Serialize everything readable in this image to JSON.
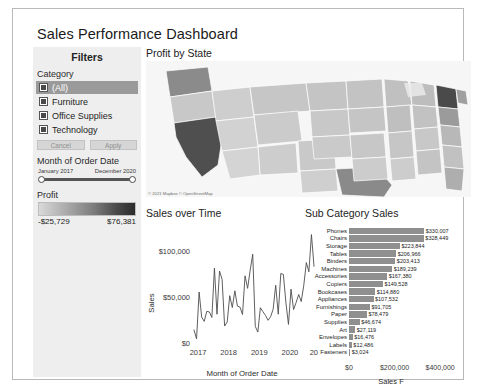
{
  "dashboard": {
    "title": "Sales Performance Dashboard"
  },
  "filters": {
    "header": "Filters",
    "category_label": "Category",
    "options": [
      {
        "label": "(All)",
        "checked": true,
        "selected": true
      },
      {
        "label": "Furniture",
        "checked": true,
        "selected": false
      },
      {
        "label": "Office Supplies",
        "checked": true,
        "selected": false
      },
      {
        "label": "Technology",
        "checked": true,
        "selected": false
      }
    ],
    "cancel_label": "Cancel",
    "apply_label": "Apply",
    "date_label": "Month of Order Date",
    "date_start": "January 2017",
    "date_end": "December 2020",
    "profit_label": "Profit",
    "profit_min": "-$25,729",
    "profit_max": "$76,381"
  },
  "map": {
    "title": "Profit by State",
    "attribution": "© 2021 Mapbox © OpenStreetMap"
  },
  "line_chart_title": "Sales over Time",
  "bar_chart_title": "Sub Category Sales",
  "chart_data": [
    {
      "type": "line",
      "title": "Sales over Time",
      "xlabel": "Month of Order Date",
      "ylabel": "Sales",
      "ytick_labels": [
        "$0",
        "$50,000",
        "$100,000"
      ],
      "ytick_values": [
        0,
        50000,
        100000
      ],
      "ylim": [
        0,
        118000
      ],
      "xtick_labels": [
        "2017",
        "2018",
        "2019",
        "2020",
        "2021"
      ],
      "grid": false,
      "x": [
        "2017-01",
        "2017-02",
        "2017-03",
        "2017-04",
        "2017-05",
        "2017-06",
        "2017-07",
        "2017-08",
        "2017-09",
        "2017-10",
        "2017-11",
        "2017-12",
        "2018-01",
        "2018-02",
        "2018-03",
        "2018-04",
        "2018-05",
        "2018-06",
        "2018-07",
        "2018-08",
        "2018-09",
        "2018-10",
        "2018-11",
        "2018-12",
        "2019-01",
        "2019-02",
        "2019-03",
        "2019-04",
        "2019-05",
        "2019-06",
        "2019-07",
        "2019-08",
        "2019-09",
        "2019-10",
        "2019-11",
        "2019-12",
        "2020-01",
        "2020-02",
        "2020-03",
        "2020-04",
        "2020-05",
        "2020-06",
        "2020-07",
        "2020-08",
        "2020-09",
        "2020-10",
        "2020-11",
        "2020-12"
      ],
      "values": [
        14236,
        4520,
        55691,
        28295,
        23648,
        34595,
        33946,
        27909,
        81777,
        31453,
        78629,
        69545,
        18542,
        22979,
        51716,
        38750,
        56987,
        40344,
        39262,
        31115,
        73410,
        59688,
        79412,
        96999,
        18174,
        11951,
        38560,
        34196,
        30131,
        24797,
        28765,
        36898,
        63133,
        31453,
        75972,
        74920,
        43971,
        20301,
        58872,
        36522,
        44261,
        52982,
        45264,
        63121,
        87866,
        77777,
        118448,
        83829
      ]
    },
    {
      "type": "bar",
      "title": "Sub Category Sales",
      "xlabel": "Sales F",
      "orientation": "horizontal",
      "xtick_labels": [
        "$0",
        "$200,000",
        "$400,000"
      ],
      "xtick_values": [
        0,
        200000,
        400000
      ],
      "xlim": [
        0,
        430000
      ],
      "categories": [
        "Phones",
        "Chairs",
        "Storage",
        "Tables",
        "Binders",
        "Machines",
        "Accessories",
        "Copiers",
        "Bookcases",
        "Appliances",
        "Furnishings",
        "Paper",
        "Supplies",
        "Art",
        "Envelopes",
        "Labels",
        "Fasteners"
      ],
      "values": [
        330007,
        328449,
        223844,
        206966,
        203413,
        189239,
        167380,
        149528,
        114880,
        107532,
        91705,
        78479,
        46674,
        27119,
        16476,
        12486,
        3024
      ],
      "value_labels": [
        "$330,007",
        "$328,449",
        "$223,844",
        "$206,966",
        "$203,413",
        "$189,239",
        "$167,380",
        "$149,528",
        "$114,880",
        "$107,532",
        "$91,705",
        "$78,479",
        "$46,674",
        "$27,119",
        "$16,476",
        "$12,486",
        "$3,024"
      ]
    }
  ]
}
